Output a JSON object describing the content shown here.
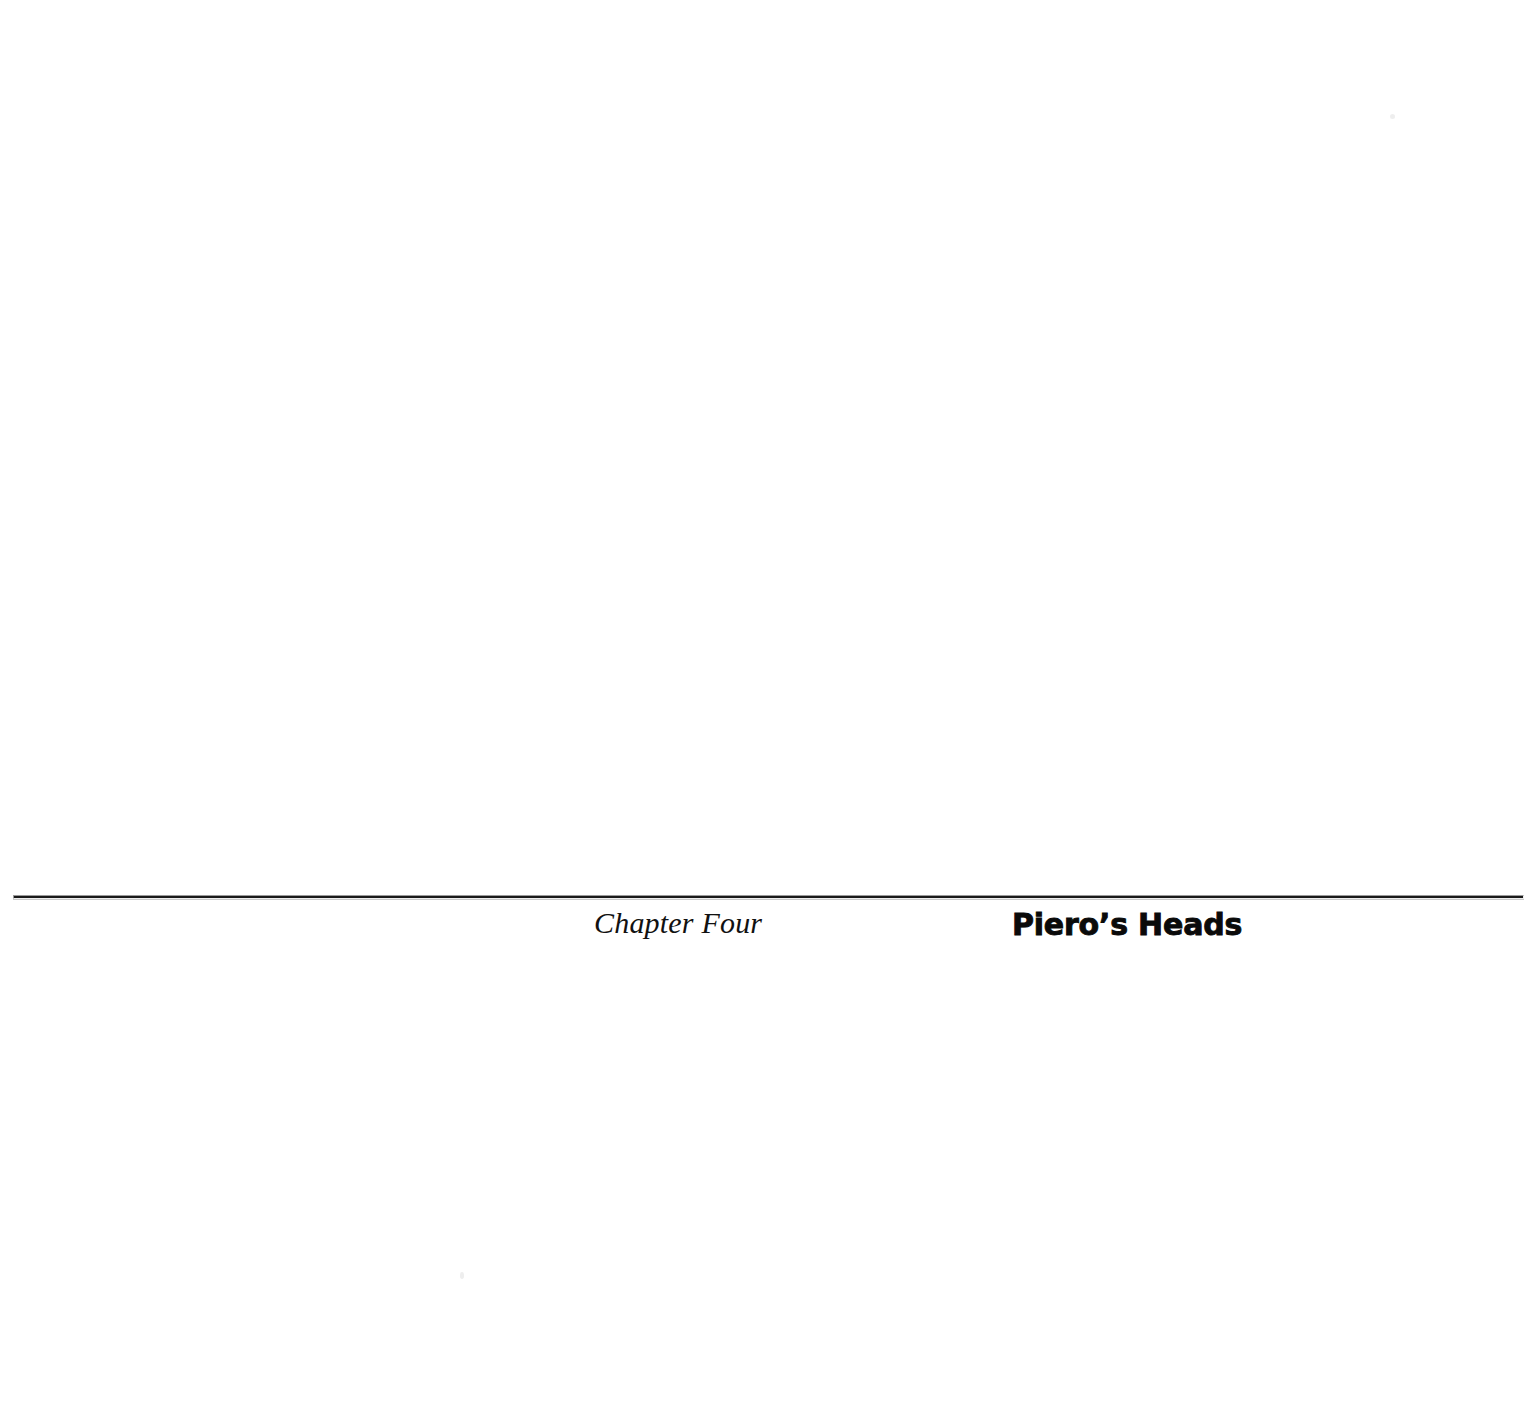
{
  "page": {
    "background_color": "#ffffff",
    "width": 1534,
    "height": 1417
  },
  "chapter_opening": {
    "rule": {
      "name": "horizontal-rule",
      "color": "#1a1a1a"
    },
    "label": "Chapter Four",
    "title": "Piero’s Heads"
  },
  "artifacts": {
    "speck_upper_right": "",
    "speck_lower_left": ""
  }
}
